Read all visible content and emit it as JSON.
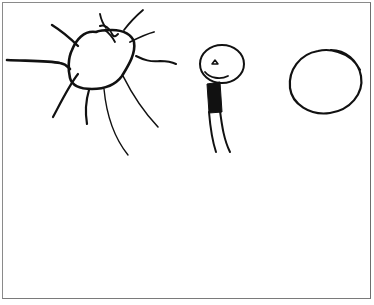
{
  "drawing": {
    "description": "Child's pencil drawing: a sun with rays, a smiling stick figure, and a circle",
    "elements": [
      {
        "name": "sun",
        "icon": "sun-icon"
      },
      {
        "name": "stick-figure",
        "icon": "person-icon"
      },
      {
        "name": "circle",
        "icon": "circle-icon"
      }
    ],
    "colors": {
      "ink": "#111111",
      "paper": "#ffffff",
      "border": "#8a8a8a"
    }
  }
}
